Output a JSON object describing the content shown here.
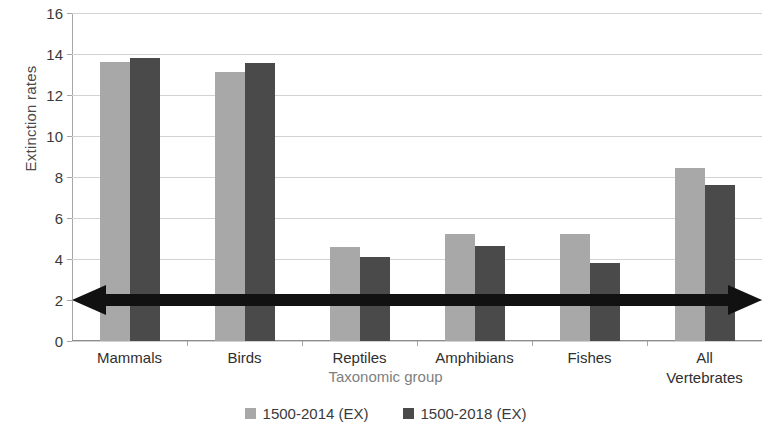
{
  "chart_data": {
    "type": "bar",
    "title": "",
    "xlabel": "Taxonomic group",
    "ylabel": "Extinction rates",
    "categories": [
      "Mammals",
      "Birds",
      "Reptiles",
      "Amphibians",
      "Fishes",
      "All\nVertebrates"
    ],
    "category_labels": [
      [
        "Mammals"
      ],
      [
        "Birds"
      ],
      [
        "Reptiles"
      ],
      [
        "Amphibians"
      ],
      [
        "Fishes"
      ],
      [
        "All",
        "Vertebrates"
      ]
    ],
    "series": [
      {
        "name": "1500-2014 (EX)",
        "color": "#a8a8a8",
        "values": [
          13.6,
          13.1,
          4.6,
          5.2,
          5.2,
          8.45
        ]
      },
      {
        "name": "1500-2018 (EX)",
        "color": "#4a4a4a",
        "values": [
          13.8,
          13.55,
          4.1,
          4.65,
          3.8,
          7.6
        ]
      }
    ],
    "ylim": [
      0,
      16
    ],
    "yticks": [
      0,
      2,
      4,
      6,
      8,
      10,
      12,
      14,
      16
    ],
    "ytick_labels": [
      "0",
      "2",
      "4",
      "6",
      "8",
      "10",
      "12",
      "14",
      "16"
    ],
    "grid": true,
    "grid_axis": "y",
    "legend_position": "bottom",
    "annotations": [
      {
        "type": "double-headed-arrow",
        "name": "threshold-arrow",
        "y_value": 2,
        "color": "#111111",
        "spans_plot_width": true
      }
    ]
  },
  "legend": {
    "items": [
      {
        "label": "1500-2014 (EX)",
        "color": "#a8a8a8"
      },
      {
        "label": "1500-2018 (EX)",
        "color": "#4a4a4a"
      }
    ]
  },
  "axes": {
    "y_title": "Extinction rates",
    "x_title": "Taxonomic group"
  }
}
